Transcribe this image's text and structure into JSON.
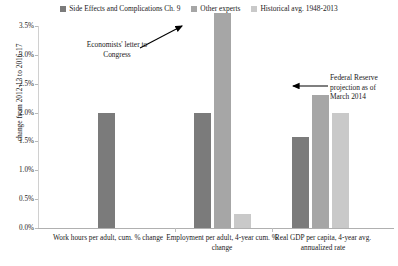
{
  "chart_data": {
    "type": "bar",
    "title": "",
    "xlabel": "",
    "ylabel": "change from 2012-13 to 2016-17",
    "ylim": [
      0,
      3.5
    ],
    "ytick_labels": [
      "0.0%",
      "0.5%",
      "1.0%",
      "1.5%",
      "2.0%",
      "2.5%",
      "3.0%",
      "3.5%"
    ],
    "ytick_values": [
      0,
      0.5,
      1.0,
      1.5,
      2.0,
      2.5,
      3.0,
      3.5
    ],
    "grid": false,
    "legend_position": "top-center",
    "categories": [
      "Work hours per adult, cum. % change",
      "Employment per adult, 4-year cum. % change",
      "Real GDP per capita, 4-year avg. annualized rate"
    ],
    "series": [
      {
        "name": "Side Effects and Complications Ch. 9",
        "color": "#7b7b7b",
        "values": [
          2.0,
          2.0,
          1.58
        ]
      },
      {
        "name": "Other experts",
        "color": "#a6a6a6",
        "values": [
          null,
          3.72,
          2.3
        ]
      },
      {
        "name": "Historical avg. 1948-2013",
        "color": "#c9c9c9",
        "values": [
          null,
          0.25,
          2.0
        ]
      }
    ],
    "annotations": [
      {
        "id": "economists-letter",
        "text": "Economists' letter to Congress",
        "points_to": "Other experts bar in Employment per adult group"
      },
      {
        "id": "fed-projection",
        "text": "Federal Reserve projection as of March 2014",
        "points_to": "Other experts bar in Real GDP per capita group"
      }
    ]
  },
  "legend": {
    "items": [
      {
        "label": "Side Effects and Complications Ch. 9",
        "color": "#7b7b7b"
      },
      {
        "label": "Other experts",
        "color": "#a6a6a6"
      },
      {
        "label": "Historical avg. 1948-2013",
        "color": "#c9c9c9"
      }
    ]
  },
  "axis": {
    "y_title": "change from 2012-13 to 2016-17"
  },
  "annotations": {
    "economists": "Economists' letter to Congress",
    "federal_reserve": "Federal Reserve projection as of March 2014"
  }
}
